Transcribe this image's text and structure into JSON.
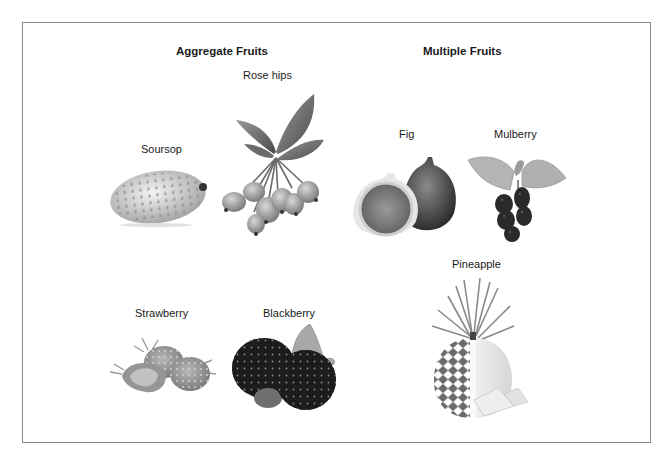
{
  "title_mark": "",
  "groups": [
    {
      "heading": "Aggregate Fruits",
      "fruits": [
        {
          "name": "Rose hips",
          "icon": "rose-hips-photo"
        },
        {
          "name": "Soursop",
          "icon": "soursop-photo"
        },
        {
          "name": "Strawberry",
          "icon": "strawberry-photo"
        },
        {
          "name": "Blackberry",
          "icon": "blackberry-photo"
        }
      ]
    },
    {
      "heading": "Multiple Fruits",
      "fruits": [
        {
          "name": "Fig",
          "icon": "fig-photo"
        },
        {
          "name": "Mulberry",
          "icon": "mulberry-photo"
        },
        {
          "name": "Pineapple",
          "icon": "pineapple-photo"
        }
      ]
    }
  ],
  "style": {
    "border_color": "#8a8a8a",
    "image_tone": "grayscale"
  }
}
